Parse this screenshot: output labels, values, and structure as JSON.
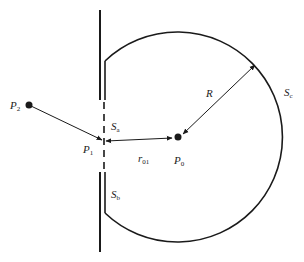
{
  "diagram": {
    "colors": {
      "stroke": "#1a1a1a",
      "background": "#ffffff"
    },
    "points": {
      "P0": {
        "label": "P",
        "sub": "0"
      },
      "P1": {
        "label": "P",
        "sub": "1"
      },
      "P2": {
        "label": "P",
        "sub": "2"
      }
    },
    "surfaces": {
      "Sa": {
        "label": "S",
        "sub": "a"
      },
      "Sb": {
        "label": "S",
        "sub": "b"
      },
      "Sc": {
        "label": "S",
        "sub": "c"
      }
    },
    "distances": {
      "R": {
        "label": "R",
        "sub": ""
      },
      "r01": {
        "label": "r",
        "sub": "01"
      }
    }
  }
}
